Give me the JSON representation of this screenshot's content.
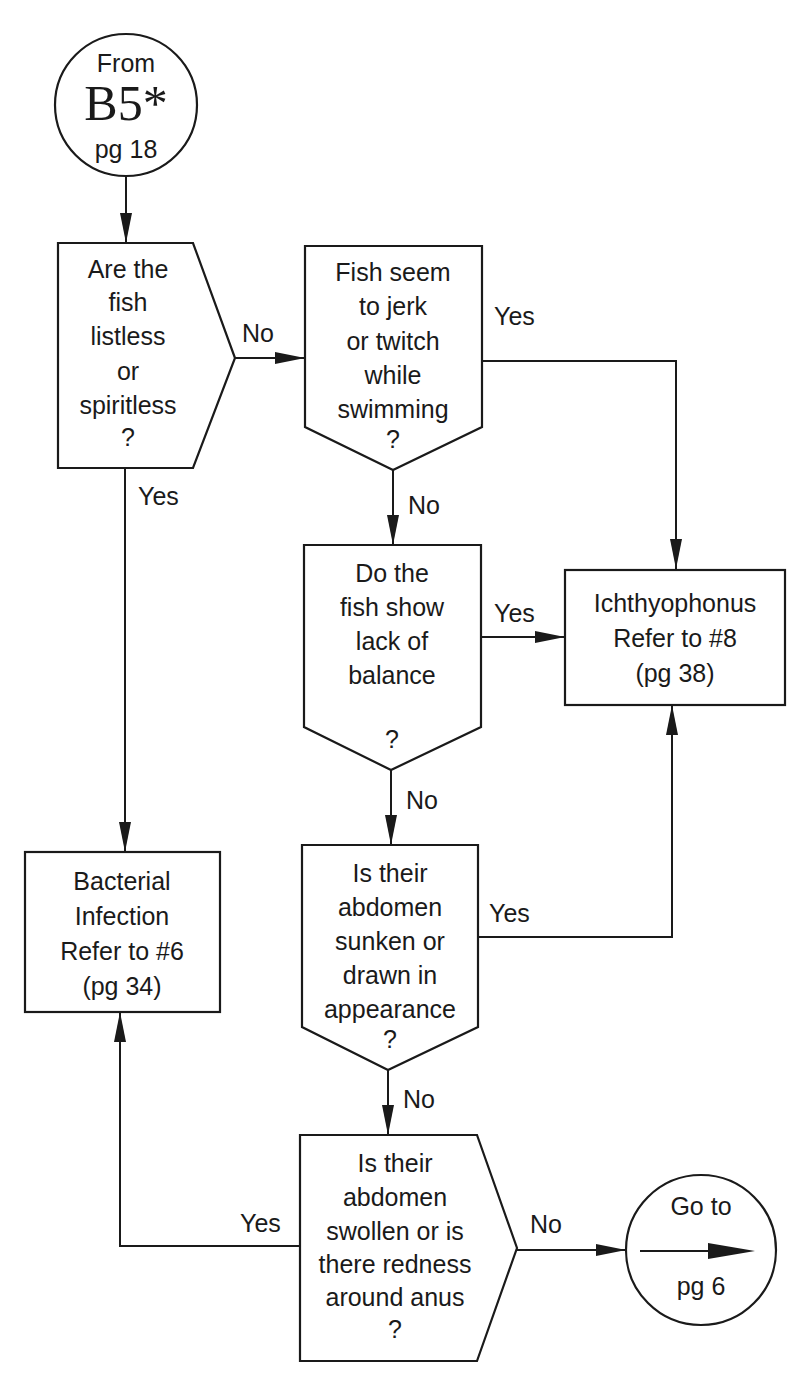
{
  "start_connector": {
    "line1": "From",
    "line2": "B5*",
    "line3": "pg 18"
  },
  "decision_listless": {
    "lines": [
      "Are the",
      "fish",
      "listless",
      "or",
      "spiritless",
      "?"
    ],
    "no_label": "No",
    "yes_label": "Yes"
  },
  "decision_jerk": {
    "lines": [
      "Fish seem",
      "to jerk",
      "or twitch",
      "while",
      "swimming",
      "?"
    ],
    "yes_label": "Yes",
    "no_label": "No"
  },
  "decision_balance": {
    "lines": [
      "Do the",
      "fish show",
      "lack of",
      "balance",
      "",
      "?"
    ],
    "yes_label": "Yes",
    "no_label": "No"
  },
  "decision_sunken": {
    "lines": [
      "Is their",
      "abdomen",
      "sunken or",
      "drawn in",
      "appearance",
      "?"
    ],
    "yes_label": "Yes",
    "no_label": "No"
  },
  "decision_swollen": {
    "lines": [
      "Is their",
      "abdomen",
      "swollen or is",
      "there redness",
      "around anus",
      "?"
    ],
    "yes_label": "Yes",
    "no_label": "No"
  },
  "result_ichthyophonus": {
    "lines": [
      "Ichthyophonus",
      "Refer to #8",
      "(pg 38)"
    ]
  },
  "result_bacterial": {
    "lines": [
      "Bacterial",
      "Infection",
      "Refer to #6",
      "(pg 34)"
    ]
  },
  "end_connector": {
    "line1": "Go to",
    "line2": "pg 6"
  },
  "colors": {
    "ink": "#1a1a1a",
    "background": "#ffffff"
  }
}
